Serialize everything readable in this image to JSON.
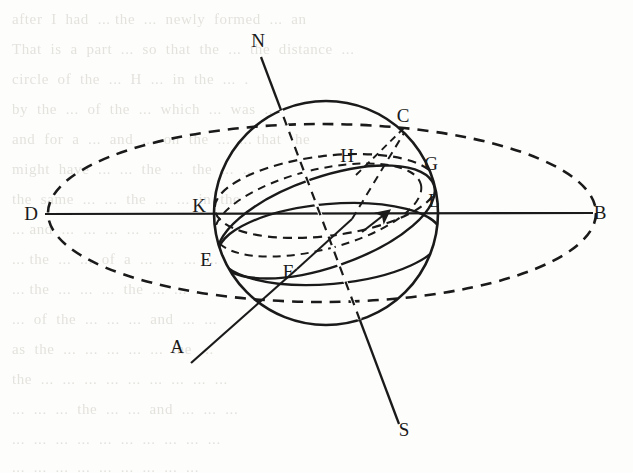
{
  "figure": {
    "kind": "celestial-sphere-diagram",
    "ink_color": "#1a1a1a",
    "page_color": "#fdfdfb",
    "bg_text_color": "#cfccc6",
    "labels": [
      {
        "id": "N",
        "text": "N",
        "x": 258,
        "y": 47,
        "role": "north-celestial-pole"
      },
      {
        "id": "C",
        "text": "C",
        "x": 403,
        "y": 122,
        "role": "point-c"
      },
      {
        "id": "H",
        "text": "H",
        "x": 347,
        "y": 162,
        "role": "point-h"
      },
      {
        "id": "G",
        "text": "G",
        "x": 431,
        "y": 170,
        "role": "point-g"
      },
      {
        "id": "D",
        "text": "D",
        "x": 31,
        "y": 220,
        "role": "west-horizon-point"
      },
      {
        "id": "K",
        "text": "K",
        "x": 199,
        "y": 212,
        "role": "point-k"
      },
      {
        "id": "L",
        "text": "L",
        "x": 434,
        "y": 207,
        "role": "point-l"
      },
      {
        "id": "B",
        "text": "B",
        "x": 600,
        "y": 219,
        "role": "east-horizon-point"
      },
      {
        "id": "E",
        "text": "E",
        "x": 206,
        "y": 266,
        "role": "point-e"
      },
      {
        "id": "F",
        "text": "F",
        "x": 288,
        "y": 278,
        "role": "point-f"
      },
      {
        "id": "A",
        "text": "A",
        "x": 177,
        "y": 353,
        "role": "point-a"
      },
      {
        "id": "S",
        "text": "S",
        "x": 404,
        "y": 436,
        "role": "south-celestial-pole"
      }
    ],
    "geometry": {
      "sphere": {
        "cx": 326,
        "cy": 213,
        "r": 112
      },
      "horizon_ellipse": {
        "cx": 322,
        "cy": 213,
        "rx": 274,
        "ry": 89,
        "style": "dashed"
      },
      "equator_ellipse": {
        "cx": 326,
        "cy": 196,
        "rx": 112,
        "ry": 40,
        "rotation": -7,
        "style": "dashed"
      },
      "ecliptic_ellipse": {
        "cx": 326,
        "cy": 222,
        "rx": 114,
        "ry": 44,
        "rotation": -19,
        "style": "solid",
        "has_arrow": true
      },
      "axis_line": {
        "x1": 261,
        "y1": 57,
        "x2": 399,
        "y2": 424,
        "style": "solid"
      },
      "horizon_line": {
        "x1": 45,
        "y1": 214,
        "x2": 593,
        "y2": 213,
        "style": "solid"
      },
      "chord_AC": {
        "x1": 191,
        "y1": 363,
        "x2": 404,
        "y2": 133,
        "style": "mixed"
      },
      "arrow": {
        "x": 376,
        "y": 222,
        "angle": -36
      }
    },
    "background_text_lines": [
      "after  I  had  ... the  ...  newly  formed  ...  an",
      "That  is  a  part  ...  so  that  the  ...  the  distance  ...",
      "circle  of  the  ...  H  ...  in  the  ...  .",
      "by  the  ...  of  the  ...  which  ...  was  ...",
      "and  for  a  ...  and  ...  on  the  ...  ... that  the",
      "might  have  ...  ...  the  ...  the  ...  ...",
      "the  same  ...  ...  the  ...  ...  in  the",
      "... and  ...  ...  ...  ...  ...  ...  ...",
      "... the  ...  ...  of  a  ...  ...  ...  ...",
      "... the  ...  ...  ...  the  ...  ...  ...",
      "...  of  the  ...  ...  ...  and  ...  ...",
      "as  the  ...  ...  ...  ...  ...  the  ...",
      "the  ...  ...  ...  ...  ...  ...  ...  ...  ...",
      "...  ...  ...  the  ...  ...  and  ...  ...  ...",
      "...  ...  ...  ...  ...  ...  ...  ...  ...  ...",
      "...  ...  ...  ...  ...  ...  ...  ...  ...",
      "...  ...  ...  ...  ...  ...  ...  ...  ..."
    ]
  }
}
